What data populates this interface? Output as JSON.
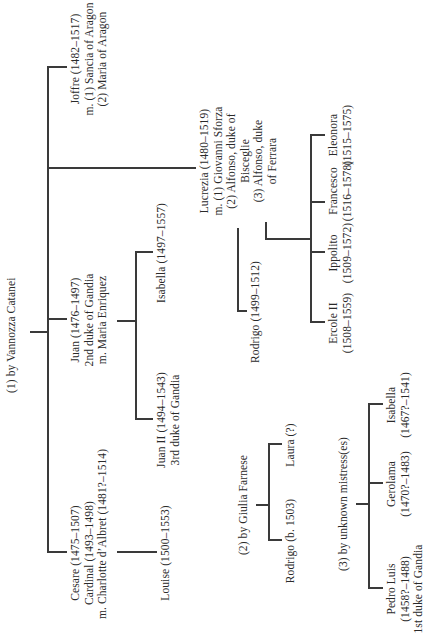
{
  "groups": {
    "vannozza": {
      "label": "(1) by Vannozza Catanei",
      "children": {
        "cesare": {
          "lines": [
            "Cesare (1475–1507)",
            "Cardinal (1493–1498)",
            "m. Charlotte d’Albret (1481?–1514)"
          ],
          "children": {
            "louise": {
              "lines": [
                "Louise (1500–1553)"
              ]
            }
          }
        },
        "juan": {
          "lines": [
            "Juan (1476–1497)",
            "2nd duke of Gandia",
            "m. Maria Enriquez"
          ],
          "children": {
            "juan2": {
              "lines": [
                "Juan II (1494–1543)",
                "3rd duke of Gandia"
              ]
            },
            "isabella": {
              "lines": [
                "Isabella (1497–1557)"
              ]
            }
          }
        },
        "lucrezia": {
          "lines": [
            "Lucrezia (1480–1519)",
            "m. (1) Giovanni Sforza",
            "(2) Alfonso, duke of",
            "Bisceglie",
            "(3) Alfonso, duke",
            "of Ferrara"
          ],
          "children": {
            "rodrigo": {
              "lines": [
                "Rodrigo (1499–1512)"
              ]
            },
            "ercole": {
              "lines": [
                "Ercole II",
                "(1508–1559)"
              ]
            },
            "ippolito": {
              "lines": [
                "Ippolito",
                "(1509–1572)"
              ]
            },
            "francesco": {
              "lines": [
                "Francesco",
                "(1516–1578)"
              ]
            },
            "eleonora": {
              "lines": [
                "Eleonora",
                "(1515–1575)"
              ]
            }
          }
        },
        "joffre": {
          "lines": [
            "Joffre (1482–1517)",
            "m. (1) Sancia of Aragon",
            "(2) Maria of Aragon"
          ]
        }
      }
    },
    "giulia": {
      "label": "(2) by Giulia Farnese",
      "children": {
        "rodrigo": {
          "lines": [
            "Rodrigo (b. 1503)"
          ]
        },
        "laura": {
          "lines": [
            "Laura (?)"
          ]
        }
      }
    },
    "mistresses": {
      "label": "(3) by unknown mistress(es)",
      "children": {
        "pedro": {
          "lines": [
            "Pedro Luis",
            "(1458?–1488)",
            "1st duke of Gandia"
          ]
        },
        "gerolama": {
          "lines": [
            "Gerolama",
            "(1470?–1483)"
          ]
        },
        "isabella": {
          "lines": [
            "Isabella",
            "(1467?–1541)"
          ]
        }
      }
    }
  },
  "colors": {
    "line": "#3a3a3a",
    "text": "#2a2a2a",
    "background": "#ffffff"
  }
}
